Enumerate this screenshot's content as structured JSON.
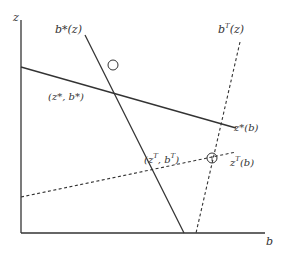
{
  "diagram": {
    "axes": {
      "y_label": "z",
      "x_label": "b"
    },
    "curves": [
      {
        "id": "b_star",
        "label": "b*(z)",
        "style": "solid"
      },
      {
        "id": "z_star",
        "label": "z*(b)",
        "style": "solid"
      },
      {
        "id": "b_T",
        "label": "b",
        "sup": "T",
        "suffix": "(z)",
        "style": "dashed"
      },
      {
        "id": "z_T",
        "label": "z",
        "sup": "T",
        "suffix": "(b)",
        "style": "dashed"
      }
    ],
    "points": [
      {
        "id": "nash",
        "label": "(z*, b*)"
      },
      {
        "id": "team",
        "label_open": "(z",
        "sup1": "T",
        "label_mid": ", b",
        "sup2": "T",
        "label_close": ")"
      }
    ],
    "colors": {
      "line": "#333333",
      "background": "#ffffff"
    }
  }
}
